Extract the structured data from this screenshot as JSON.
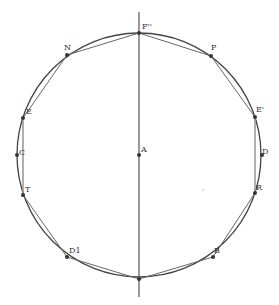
{
  "diagram": {
    "title": "",
    "circle": {
      "cx": 139,
      "cy": 155,
      "r": 122,
      "stroke": "#444444"
    },
    "axis_line": {
      "x": 139,
      "y1": 12,
      "y2": 297,
      "stroke": "#555555"
    },
    "points": [
      {
        "id": "F2",
        "label": "F''",
        "x": 139,
        "y": 33,
        "lx": 142,
        "ly": 23
      },
      {
        "id": "N",
        "label": "N",
        "x": 67,
        "y": 55,
        "lx": 64,
        "ly": 44
      },
      {
        "id": "P",
        "label": "P",
        "x": 211,
        "y": 56,
        "lx": 211,
        "ly": 44
      },
      {
        "id": "E",
        "label": "E",
        "x": 23,
        "y": 118,
        "lx": 26,
        "ly": 108
      },
      {
        "id": "E1",
        "label": "E'",
        "x": 255,
        "y": 117,
        "lx": 256,
        "ly": 106
      },
      {
        "id": "C",
        "label": "C",
        "x": 17,
        "y": 155,
        "lx": 19,
        "ly": 149
      },
      {
        "id": "D",
        "label": "D",
        "x": 262,
        "y": 155,
        "lx": 262,
        "ly": 148
      },
      {
        "id": "A",
        "label": "A",
        "x": 139,
        "y": 155,
        "lx": 141,
        "ly": 146
      },
      {
        "id": "T",
        "label": "T",
        "x": 23,
        "y": 195,
        "lx": 25,
        "ly": 186
      },
      {
        "id": "R",
        "label": "R",
        "x": 255,
        "y": 193,
        "lx": 256,
        "ly": 184
      },
      {
        "id": "D1",
        "label": "D1",
        "x": 67,
        "y": 257,
        "lx": 69,
        "ly": 247
      },
      {
        "id": "B",
        "label": "B",
        "x": 213,
        "y": 257,
        "lx": 214,
        "ly": 247
      },
      {
        "id": "F3",
        "label": "",
        "x": 139,
        "y": 279,
        "lx": 0,
        "ly": 0
      }
    ],
    "polygon_order": [
      "F2",
      "P",
      "E1",
      "R",
      "B",
      "F3",
      "D1",
      "T",
      "E",
      "N",
      "F2"
    ],
    "extra_chords": [
      [
        "E1",
        "R"
      ],
      [
        "E",
        "T"
      ]
    ],
    "stray_dot": {
      "x": 203,
      "y": 190
    },
    "colors": {
      "line": "#555555",
      "chord": "#666666",
      "point": "#333333",
      "label": "#333333"
    }
  }
}
